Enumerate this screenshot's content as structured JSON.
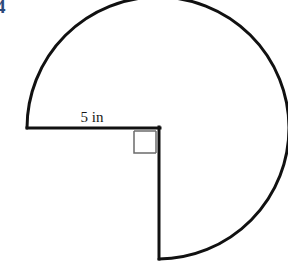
{
  "page": {
    "background_color": "#ffffff",
    "width": 288,
    "height": 267
  },
  "problem": {
    "number": "4",
    "number_color": "#2d4a7a"
  },
  "figure": {
    "name": "circle-with-quarter-sector-removed",
    "shape_description": "Circle with the lower-left quarter sector removed (three-quarter circle / pac-man shape)",
    "stroke_color": "#111111",
    "stroke_width": 3,
    "fill": "none",
    "center_x": 158,
    "center_y": 128,
    "radius_px": 131,
    "arc_sweep_degrees": 270,
    "arc_start_angle_degrees": 180,
    "arc_end_angle_degrees": 90,
    "radius_label": "5 in",
    "radius_label_value": "5",
    "radius_label_unit": "in",
    "radius_label_x": 92,
    "radius_label_y": 122,
    "horizontal_radius": {
      "name": "horizontal-radius-segment",
      "x1": 27,
      "y1": 128,
      "x2": 159,
      "y2": 128
    },
    "vertical_radius": {
      "name": "vertical-radius-segment",
      "x1": 159,
      "y1": 128,
      "x2": 159,
      "y2": 259
    },
    "right_angle_marker": {
      "name": "right-angle-marker",
      "x": 133,
      "y": 130,
      "size": 24,
      "stroke_color": "#6b6b6b",
      "stroke_width": 1.5
    }
  }
}
